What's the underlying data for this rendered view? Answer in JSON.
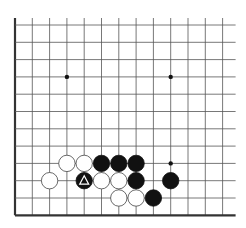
{
  "board": {
    "cols": 13,
    "rows": 12,
    "x0": 15,
    "y0": 25,
    "dx": 17.3,
    "dy": 17.3,
    "edges": [
      "left",
      "bottom"
    ],
    "line_color": "#555555",
    "edge_color": "#333333",
    "star_points": [
      [
        3,
        3
      ],
      [
        9,
        3
      ],
      [
        9,
        8
      ]
    ],
    "stones": [
      {
        "col": 3,
        "row": 8,
        "color": "white"
      },
      {
        "col": 4,
        "row": 8,
        "color": "white"
      },
      {
        "col": 5,
        "row": 8,
        "color": "black"
      },
      {
        "col": 6,
        "row": 8,
        "color": "black"
      },
      {
        "col": 7,
        "row": 8,
        "color": "black"
      },
      {
        "col": 2,
        "row": 9,
        "color": "white"
      },
      {
        "col": 4,
        "row": 9,
        "color": "black",
        "marker": "triangle"
      },
      {
        "col": 5,
        "row": 9,
        "color": "white"
      },
      {
        "col": 6,
        "row": 9,
        "color": "white"
      },
      {
        "col": 7,
        "row": 9,
        "color": "black"
      },
      {
        "col": 9,
        "row": 9,
        "color": "black"
      },
      {
        "col": 6,
        "row": 10,
        "color": "white"
      },
      {
        "col": 7,
        "row": 10,
        "color": "white"
      },
      {
        "col": 8,
        "row": 10,
        "color": "black"
      }
    ]
  }
}
